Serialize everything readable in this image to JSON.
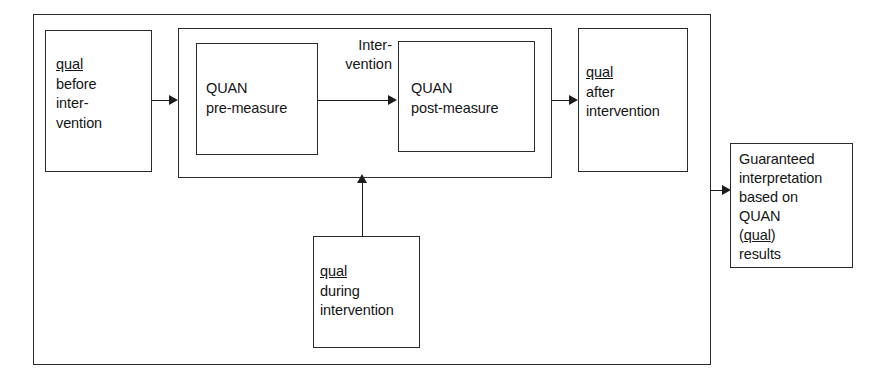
{
  "diagram": {
    "boxes": {
      "qual_before": {
        "lines": [
          "qual",
          "before",
          "inter-",
          "vention"
        ],
        "underlined_first_word": "qual"
      },
      "quan_pre": {
        "lines": [
          "QUAN",
          "pre-measure"
        ]
      },
      "quan_post": {
        "lines": [
          "QUAN",
          "post-measure"
        ]
      },
      "qual_after": {
        "lines": [
          "qual",
          "after",
          "intervention"
        ],
        "underlined_first_word": "qual"
      },
      "qual_during": {
        "lines": [
          "qual",
          "during",
          "intervention"
        ],
        "underlined_first_word": "qual"
      },
      "interpretation": {
        "lines": [
          "Guaranteed",
          "interpretation",
          "based on",
          "QUAN",
          "(qual)",
          "results"
        ],
        "underlined_word": "qual"
      }
    },
    "edge_labels": {
      "intervention": [
        "Inter-",
        "vention"
      ]
    },
    "colors": {
      "stroke": "#2b2b2b",
      "arrow": "#1d1d1d",
      "text": "#151515",
      "background": "#ffffff"
    }
  }
}
